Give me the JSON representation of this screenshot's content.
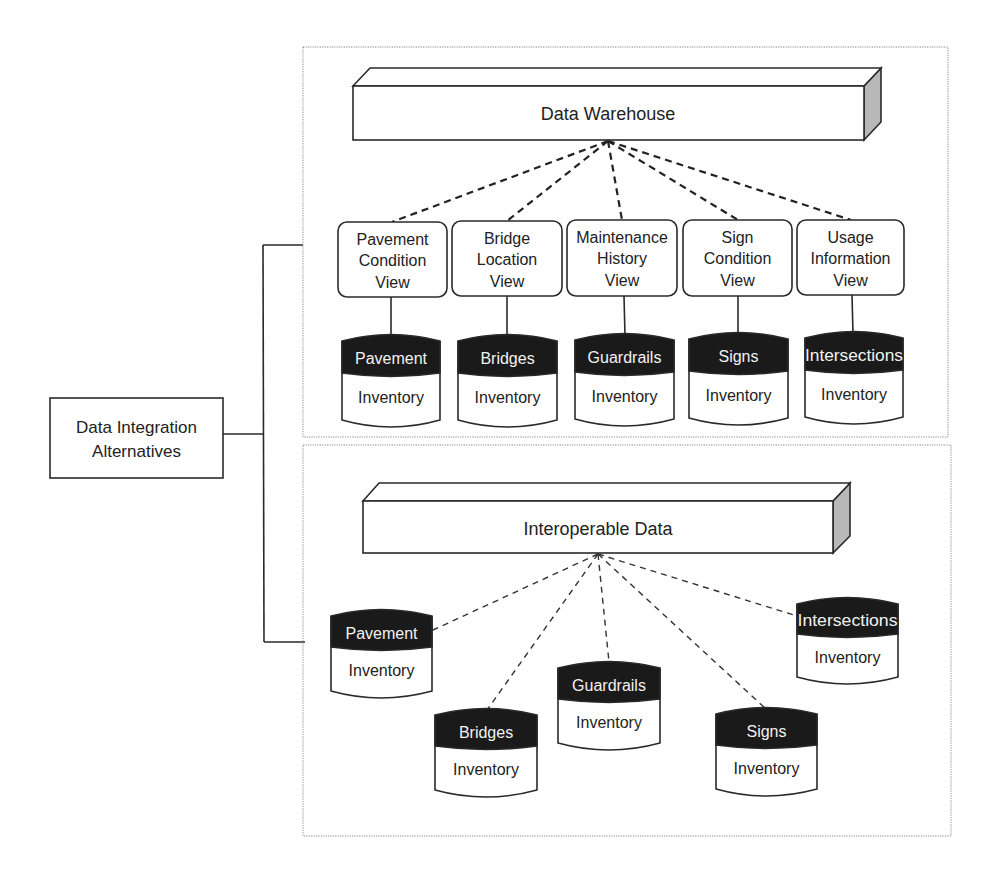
{
  "root": {
    "label_line1": "Data Integration",
    "label_line2": "Alternatives"
  },
  "colors": {
    "line": "#2a2a2a",
    "cylinder_top": "#1a1a1a",
    "cylinder_label": "#f2f2f2",
    "side_face": "#b8b8b8",
    "frame": "#8a8a8a"
  },
  "warehouse": {
    "title": "Data Warehouse",
    "views": [
      {
        "line1": "Pavement",
        "line2": "Condition",
        "line3": "View"
      },
      {
        "line1": "Bridge",
        "line2": "Location",
        "line3": "View"
      },
      {
        "line1": "Maintenance",
        "line2": "History",
        "line3": "View"
      },
      {
        "line1": "Sign",
        "line2": "Condition",
        "line3": "View"
      },
      {
        "line1": "Usage",
        "line2": "Information",
        "line3": "View"
      }
    ],
    "databases": [
      {
        "name": "Pavement",
        "type": "Inventory"
      },
      {
        "name": "Bridges",
        "type": "Inventory"
      },
      {
        "name": "Guardrails",
        "type": "Inventory"
      },
      {
        "name": "Signs",
        "type": "Inventory"
      },
      {
        "name": "Intersections",
        "type": "Inventory"
      }
    ]
  },
  "interoperable": {
    "title": "Interoperable Data",
    "databases": [
      {
        "name": "Pavement",
        "type": "Inventory"
      },
      {
        "name": "Bridges",
        "type": "Inventory"
      },
      {
        "name": "Guardrails",
        "type": "Inventory"
      },
      {
        "name": "Signs",
        "type": "Inventory"
      },
      {
        "name": "Intersections",
        "type": "Inventory"
      }
    ]
  }
}
